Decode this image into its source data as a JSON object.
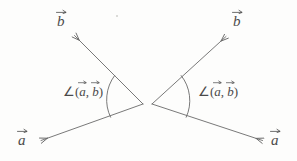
{
  "figure": {
    "background_color": "#fdfdfc",
    "stroke_color": "#6a6a6a",
    "text_color": "#4a4a4a",
    "panels": [
      {
        "id": "left-panel",
        "name": "obtuse-angle-diagram",
        "description": "Vectors a and b drawn tail-to-tail pointing left-down and left-up, angle arc between them",
        "vertex": {
          "x": 143,
          "y": 104
        },
        "vectors": [
          {
            "name": "vector-b",
            "label": "b",
            "tip": {
              "x": 72,
              "y": 33
            },
            "direction": "up-left"
          },
          {
            "name": "vector-a",
            "label": "a",
            "tip": {
              "x": 38,
              "y": 141
            },
            "direction": "down-left"
          }
        ],
        "arc": {
          "radius": 35,
          "start": {
            "x": 115,
            "y": 76
          },
          "end": {
            "x": 111,
            "y": 117
          }
        },
        "angle_label": "∠(a, b)",
        "angle_label_parts": {
          "prefix": "∠(",
          "first": "a",
          "separator": ", ",
          "second": "b",
          "suffix": ")"
        }
      },
      {
        "id": "right-panel",
        "name": "acute-angle-diagram",
        "description": "Vectors a and b drawn tail-to-tail pointing right-up and right-down, angle arc between them",
        "vertex": {
          "x": 152,
          "y": 104
        },
        "vectors": [
          {
            "name": "vector-b",
            "label": "b",
            "tip": {
              "x": 228,
              "y": 34
            },
            "direction": "up-right"
          },
          {
            "name": "vector-a",
            "label": "a",
            "tip": {
              "x": 265,
              "y": 141
            },
            "direction": "down-right"
          }
        ],
        "arc": {
          "radius": 35,
          "start": {
            "x": 181,
            "y": 76
          },
          "end": {
            "x": 186,
            "y": 117
          }
        },
        "angle_label": "∠(a, b)",
        "angle_label_parts": {
          "prefix": "∠(",
          "first": "a",
          "separator": ", ",
          "second": "b",
          "suffix": ")"
        }
      }
    ]
  },
  "labels": {
    "left_b": "b",
    "left_a": "a",
    "right_b": "b",
    "right_a": "a",
    "angle_prefix": "∠(",
    "angle_sep": ", ",
    "angle_suffix": ")",
    "angle_first": "a",
    "angle_second": "b"
  }
}
